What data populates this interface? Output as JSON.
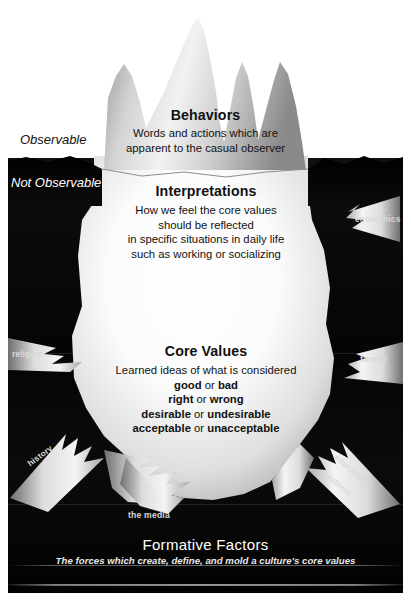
{
  "diagram": {
    "zones": {
      "observable_label": "Observable",
      "not_observable_label": "Not Observable"
    },
    "levels": [
      {
        "id": "behaviors",
        "heading": "Behaviors",
        "lines": [
          "Words and actions which are",
          "apparent to the casual observer"
        ]
      },
      {
        "id": "interpretations",
        "heading": "Interpretations",
        "lines": [
          "How we feel the core values",
          "should be reflected",
          "in specific situations in daily life",
          "such as working or socializing"
        ]
      },
      {
        "id": "core_values",
        "heading": "Core Values",
        "lead": "Learned ideas of what is considered",
        "pairs": [
          {
            "left": "good",
            "conj": "or",
            "right": "bad"
          },
          {
            "left": "right",
            "conj": "or",
            "right": "wrong"
          },
          {
            "left": "desirable",
            "conj": "or",
            "right": "undesirable"
          },
          {
            "left": "acceptable",
            "conj": "or",
            "right": "unacceptable"
          }
        ]
      }
    ],
    "factors": [
      {
        "id": "economics",
        "label": "economics"
      },
      {
        "id": "religion",
        "label": "religion"
      },
      {
        "id": "family",
        "label": "family"
      },
      {
        "id": "history",
        "label": "history"
      },
      {
        "id": "the-media",
        "label": "the media"
      },
      {
        "id": "educational-systems-1",
        "label": "educational"
      },
      {
        "id": "educational-systems-2",
        "label": "systems"
      }
    ],
    "caption": {
      "title": "Formative Factors",
      "subtitle": "The forces which create, define, and mold a culture's core values"
    },
    "colors": {
      "page_background": "#ffffff",
      "water_dark": "#070707",
      "ice_light": "#ffffff",
      "ice_shade": "#9a9a9a",
      "text_dark": "#111111",
      "text_light": "#ffffff",
      "factor_label": "#d9d9d9"
    }
  }
}
